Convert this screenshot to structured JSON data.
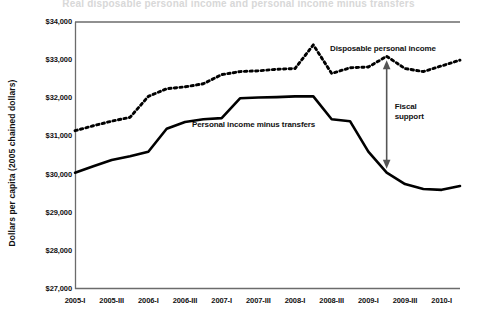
{
  "chart_data": {
    "type": "line",
    "title": "Real disposable personal income and personal income minus transfers",
    "xlabel": "",
    "ylabel": "Dollars per capita (2005 chained dollars)",
    "ylim": [
      27000,
      34000
    ],
    "ytick_step": 1000,
    "grid": false,
    "legend_position": "inline-annotation",
    "ytick_labels": [
      "$34,000",
      "$33,000",
      "$32,000",
      "$31,000",
      "$30,000",
      "$29,000",
      "$28,000",
      "$27,000"
    ],
    "ytick_values": [
      34000,
      33000,
      32000,
      31000,
      30000,
      29000,
      28000,
      27000
    ],
    "xtick_labels": [
      "2005-I",
      "2005-III",
      "2006-I",
      "2006-III",
      "2007-I",
      "2007-III",
      "2008-I",
      "2008-III",
      "2009-I",
      "2009-III",
      "2010-I"
    ],
    "x": [
      "2005-I",
      "2005-II",
      "2005-III",
      "2005-IV",
      "2006-I",
      "2006-II",
      "2006-III",
      "2006-IV",
      "2007-I",
      "2007-II",
      "2007-III",
      "2007-IV",
      "2008-I",
      "2008-II",
      "2008-III",
      "2008-IV",
      "2009-I",
      "2009-II",
      "2009-III",
      "2009-IV",
      "2010-I",
      "2010-II"
    ],
    "series": [
      {
        "name": "Disposable personal income",
        "style": "dotted",
        "color": "#000000",
        "values": [
          31150,
          31280,
          31400,
          31500,
          32050,
          32250,
          32300,
          32380,
          32620,
          32700,
          32720,
          32760,
          32780,
          33400,
          32650,
          32800,
          32820,
          33100,
          32780,
          32700,
          32850,
          33000
        ]
      },
      {
        "name": "Personal income minus transfers",
        "style": "solid",
        "color": "#000000",
        "values": [
          30050,
          30220,
          30380,
          30480,
          30600,
          31200,
          31380,
          31450,
          31480,
          32000,
          32020,
          32030,
          32050,
          32050,
          31450,
          31400,
          30600,
          30050,
          29750,
          29620,
          29600,
          29700
        ]
      }
    ],
    "annotations": [
      {
        "name": "disposable-personal-income-label",
        "text": "Disposable personal income"
      },
      {
        "name": "personal-income-minus-transfers-label",
        "text": "Personal income minus transfers"
      },
      {
        "name": "fiscal-support-label",
        "text_line1": "Fiscal",
        "text_line2": "support",
        "arrow": "double-headed-vertical"
      }
    ],
    "colors": {
      "axis": "#6b6b6b",
      "line": "#000000",
      "arrow": "#555555",
      "text": "#111111"
    }
  }
}
